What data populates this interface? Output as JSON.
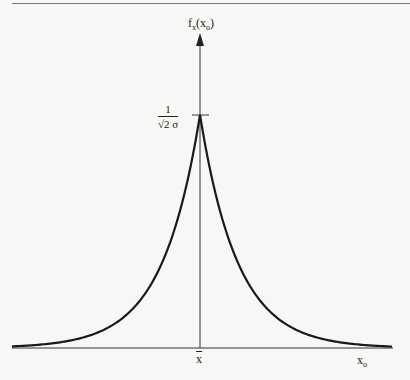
{
  "chart_data": {
    "type": "line",
    "title": "",
    "xlabel": "x_o",
    "ylabel": "f_x(x_o)",
    "x_tick_labels": [
      "x̄"
    ],
    "y_tick_labels": [
      "1/(√2 σ)"
    ],
    "peak": {
      "x": "x̄",
      "y": "1/(√2σ)"
    },
    "formula": "f_x(x_o) = (1/(√2σ)) exp(-√2 |x_o - x̄| / σ)",
    "series": [
      {
        "name": "f_x(x_o)",
        "x_sigma_units": [
          -3,
          -2.5,
          -2,
          -1.5,
          -1,
          -0.5,
          -0.25,
          0,
          0.25,
          0.5,
          1,
          1.5,
          2,
          2.5,
          3
        ],
        "y_relative_to_peak": [
          0.014,
          0.029,
          0.059,
          0.12,
          0.243,
          0.493,
          0.702,
          1.0,
          0.702,
          0.493,
          0.243,
          0.12,
          0.059,
          0.029,
          0.014
        ]
      }
    ],
    "grid": false,
    "legend": null
  },
  "labels": {
    "y_axis": "f",
    "y_axis_sub": "x",
    "y_axis_arg": "(x",
    "y_axis_arg_sub": "o",
    "y_axis_close": ")",
    "peak_num": "1",
    "peak_den": "√2 σ",
    "x_mean": "x",
    "x_axis": "x",
    "x_axis_sub": "o"
  }
}
